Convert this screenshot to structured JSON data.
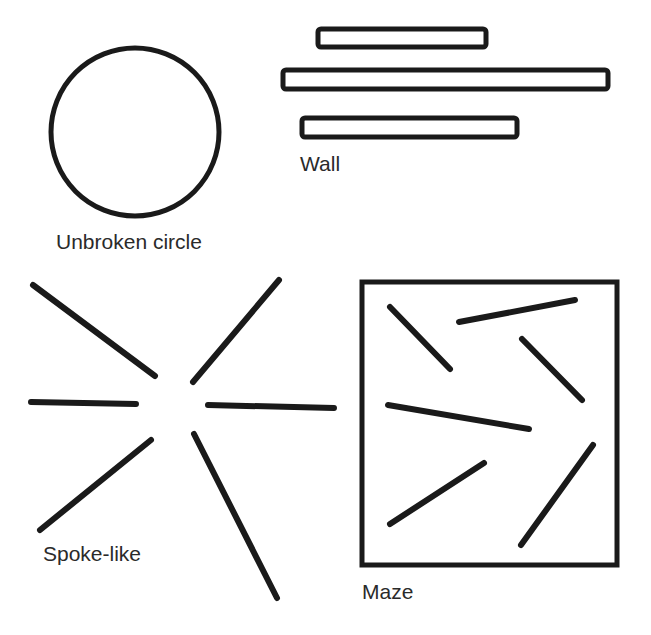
{
  "figure": {
    "stroke_color": "#1a1a1a",
    "label_color": "#2a2a2a",
    "background": "#ffffff"
  },
  "panels": {
    "circle": {
      "label": "Unbroken circle"
    },
    "wall": {
      "label": "Wall"
    },
    "spoke": {
      "label": "Spoke-like"
    },
    "maze": {
      "label": "Maze"
    }
  }
}
